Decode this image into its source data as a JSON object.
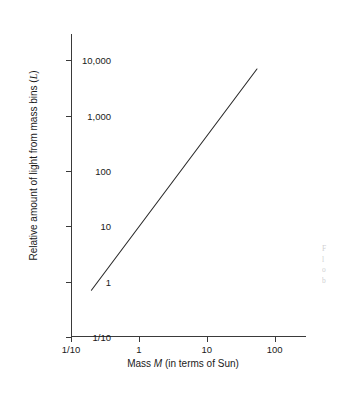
{
  "figure": {
    "background_color": "#ffffff",
    "ink_color": "#3a3a3a"
  },
  "artifacts": {
    "top_clipped_text": "",
    "side_caption_lines": [
      "F",
      "l",
      "o",
      "b"
    ]
  },
  "chart_data": {
    "type": "line",
    "title": "",
    "subtitle": "",
    "xlabel_plain": "Mass ",
    "xlabel_italic": "M",
    "xlabel_tail": " (in terms of Sun)",
    "xlabel": "Mass M (in terms of Sun)",
    "ylabel_plain": "Relative amount of light from mass bins (",
    "ylabel_symbol": "L",
    "ylabel_tail": ")",
    "ylabel": "Relative amount of light from mass bins (L)",
    "xscale": "log",
    "yscale": "log",
    "xlim": [
      0.1,
      200
    ],
    "ylim": [
      0.1,
      30000
    ],
    "grid": false,
    "legend": null,
    "xticks": [
      {
        "value": 0.1,
        "label": "1/10"
      },
      {
        "value": 1,
        "label": "1"
      },
      {
        "value": 10,
        "label": "10"
      },
      {
        "value": 100,
        "label": "100"
      }
    ],
    "yticks": [
      {
        "value": 10000,
        "label": "10,000"
      },
      {
        "value": 1000,
        "label": "1,000"
      },
      {
        "value": 100,
        "label": "100"
      },
      {
        "value": 10,
        "label": "10"
      },
      {
        "value": 1,
        "label": "1"
      },
      {
        "value": 0.1,
        "label": "1/10"
      }
    ],
    "series": [
      {
        "name": "mass-luminosity relation",
        "slope_loglog": 3.45,
        "x": [
          0.2,
          0.5,
          1,
          2,
          5,
          10,
          20,
          55
        ],
        "y": [
          0.7,
          8.5,
          48,
          260,
          3100,
          7000,
          7000,
          7000
        ],
        "endpoints": [
          {
            "x": 0.2,
            "y": 0.7
          },
          {
            "x": 55,
            "y": 7000
          }
        ],
        "color": "#2b2b2b",
        "width": 1.1
      }
    ]
  }
}
